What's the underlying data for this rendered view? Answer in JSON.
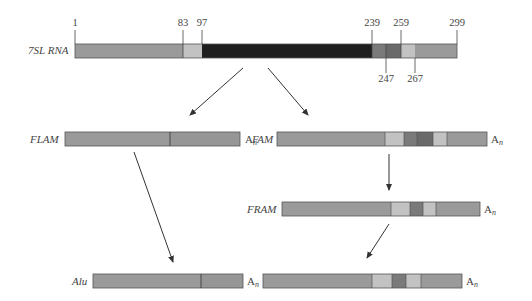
{
  "figure": {
    "source": {
      "label": "7SL RNA",
      "positions": [
        "1",
        "83",
        "97",
        "239",
        "259",
        "299"
      ],
      "positions_below": [
        "247",
        "267"
      ]
    },
    "rows": {
      "flam": {
        "label": "FLAM",
        "tail": "A",
        "tail_sub": "n"
      },
      "fam": {
        "label": "FAM",
        "tail": "A",
        "tail_sub": "n"
      },
      "fram": {
        "label": "FRAM",
        "tail": "A",
        "tail_sub": "n"
      },
      "alu": {
        "label": "Alu",
        "tail_left": "A",
        "tail_left_sub": "n",
        "tail_right": "A",
        "tail_right_sub": "n"
      }
    },
    "colors": {
      "medium_gray": "#9a9a9a",
      "light_gray": "#c2c2c2",
      "dark_gray": "#6e6e6e",
      "darker_gray": "#5a5a5a",
      "black_region": "#1e1e1e",
      "outline": "#555555"
    }
  }
}
